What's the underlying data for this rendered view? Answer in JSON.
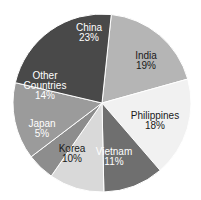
{
  "chart_data": {
    "type": "pie",
    "title": "",
    "xlabel": "",
    "ylabel": "",
    "legend": "none",
    "labels_on_slices": true,
    "total_percent": 100,
    "categories": [
      "India",
      "Philippines",
      "Vietnam",
      "Korea",
      "Japan",
      "Other Countries",
      "China"
    ],
    "values": [
      19,
      18,
      11,
      10,
      5,
      14,
      23
    ],
    "slices": [
      {
        "name": "India",
        "value": 19,
        "value_label": "19%",
        "color": "#b5b5b5",
        "text_color": "#1a1a1a",
        "start_angle": 6,
        "end_angle": 74.4,
        "label_x": 146,
        "label_y": 62
      },
      {
        "name": "Philippines",
        "value": 18,
        "value_label": "18%",
        "color": "#f1f1f1",
        "text_color": "#1a1a1a",
        "start_angle": 74.4,
        "end_angle": 139.2,
        "label_x": 155,
        "label_y": 122
      },
      {
        "name": "Vietnam",
        "value": 11,
        "value_label": "11%",
        "color": "#6f6f6f",
        "text_color": "#ffffff",
        "start_angle": 139.2,
        "end_angle": 178.8,
        "label_x": 114,
        "label_y": 158
      },
      {
        "name": "Korea",
        "value": 10,
        "value_label": "10%",
        "color": "#d9d9d9",
        "text_color": "#1a1a1a",
        "start_angle": 178.8,
        "end_angle": 214.8,
        "label_x": 72,
        "label_y": 155
      },
      {
        "name": "Japan",
        "value": 5,
        "value_label": "5%",
        "color": "#8d8d8d",
        "text_color": "#ffffff",
        "start_angle": 214.8,
        "end_angle": 232.8,
        "label_x": 42,
        "label_y": 130
      },
      {
        "name": "Other Countries",
        "value": 14,
        "value_label": "14%",
        "color": "#9b9b9b",
        "text_color": "#ffffff",
        "start_angle": 232.8,
        "end_angle": 283.2,
        "label_x": 45,
        "label_y": 82
      },
      {
        "name": "China",
        "value": 23,
        "value_label": "23%",
        "color": "#494949",
        "text_color": "#ffffff",
        "start_angle": 283.2,
        "end_angle": 366,
        "label_x": 89,
        "label_y": 34
      }
    ],
    "geometry": {
      "center_x": 102,
      "center_y": 103,
      "radius": 89
    }
  }
}
